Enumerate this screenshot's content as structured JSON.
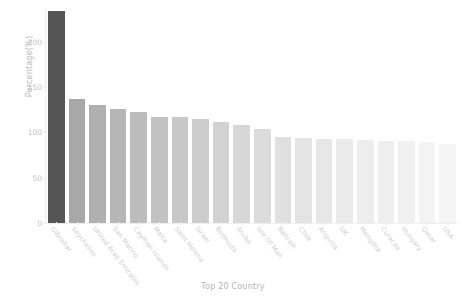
{
  "chart_data": {
    "type": "bar",
    "title": "",
    "xlabel": "Top 20 Country",
    "ylabel": "Percentage(%)",
    "ylim": [
      0,
      235
    ],
    "yticks": [
      0,
      50,
      100,
      150,
      200
    ],
    "ytick_labels": [
      "0",
      "50",
      "100",
      "150",
      "200"
    ],
    "grid": false,
    "legend": null,
    "categories": [
      "Gibraltar",
      "Seychelles",
      "United Arab Emirates",
      "San Marino",
      "Cayman Islands",
      "Malta",
      "Saint Helena",
      "Israel",
      "Bermuda",
      "Aruba",
      "Isle Of Man",
      "Bahrain",
      "Chile",
      "Anguilla",
      "UK",
      "Mongolia",
      "Curacao",
      "Hungary",
      "Qatar",
      "USA"
    ],
    "values": [
      234,
      137,
      130,
      126,
      122,
      117,
      117,
      115,
      112,
      108,
      104,
      95,
      94,
      93,
      93,
      92,
      91,
      90,
      89,
      87
    ],
    "bar_colors": [
      "#555555",
      "#a8a8a8",
      "#b0b0b0",
      "#b6b6b6",
      "#bcbcbc",
      "#c2c2c2",
      "#c8c8c8",
      "#cdcdcd",
      "#d2d2d2",
      "#d7d7d7",
      "#dcdcdc",
      "#e0e0e0",
      "#e4e4e4",
      "#e7e7e7",
      "#eaeaea",
      "#ededed",
      "#efefef",
      "#f1f1f1",
      "#f3f3f3",
      "#f5f5f5"
    ]
  },
  "axis_style": {
    "tick_text_color": "#c2c2c2",
    "label_color": "#b5b5b5",
    "spine_color": "#efefef"
  }
}
